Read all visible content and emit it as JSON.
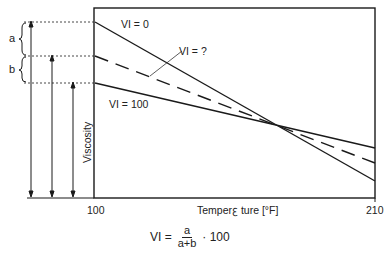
{
  "diagram": {
    "type": "viscosity-index-diagram",
    "lines": [
      {
        "label": "VI = 0",
        "style": "solid",
        "left_y": 22,
        "right_y": 181
      },
      {
        "label": "VI = ?",
        "style": "dashed",
        "left_y": 56,
        "right_y": 163
      },
      {
        "label": "VI = 100",
        "style": "solid",
        "left_y": 83,
        "right_y": 148
      }
    ],
    "line_labels": {
      "vi0": "VI = 0",
      "vi_unknown": "VI = ?",
      "vi100": "VI = 100"
    },
    "brace_labels": {
      "a": "a",
      "b": "b"
    },
    "axes": {
      "y_label": "Viscosity",
      "x_label": "Temperature [°F]",
      "x_label_rendered": "Temperꜫ ture [°F]",
      "x_ticks": [
        "100",
        "210"
      ]
    },
    "formula": {
      "lhs": "VI =",
      "numerator": "a",
      "denominator": "a+b",
      "multiplier": "· 100"
    }
  }
}
